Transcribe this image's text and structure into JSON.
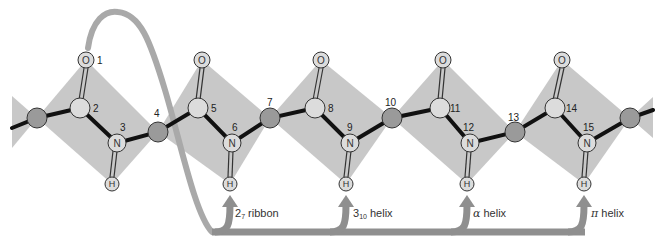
{
  "colors": {
    "plane": "#c8c8c8",
    "ca_atom": "#9a9a9a",
    "light_atom": "#dcdcdc",
    "bond": "#111111",
    "ribbon": "#a9a9a9",
    "arrow": "#8f8f8f"
  },
  "atoms": {
    "oxygen_symbol": "O",
    "nitrogen_symbol": "N",
    "hydrogen_symbol": "H"
  },
  "numbers": [
    "1",
    "2",
    "3",
    "4",
    "5",
    "6",
    "7",
    "8",
    "9",
    "10",
    "11",
    "12",
    "13",
    "14",
    "15"
  ],
  "arrows": [
    {
      "name": "2-7-ribbon",
      "prefix": "2",
      "sub": "7",
      "suffix": " ribbon"
    },
    {
      "name": "3-10-helix",
      "prefix": "3",
      "sub": "10",
      "suffix": " helix"
    },
    {
      "name": "alpha-helix",
      "prefix": "α",
      "sub": "",
      "suffix": " helix"
    },
    {
      "name": "pi-helix",
      "prefix": "π",
      "sub": "",
      "suffix": " helix"
    }
  ]
}
